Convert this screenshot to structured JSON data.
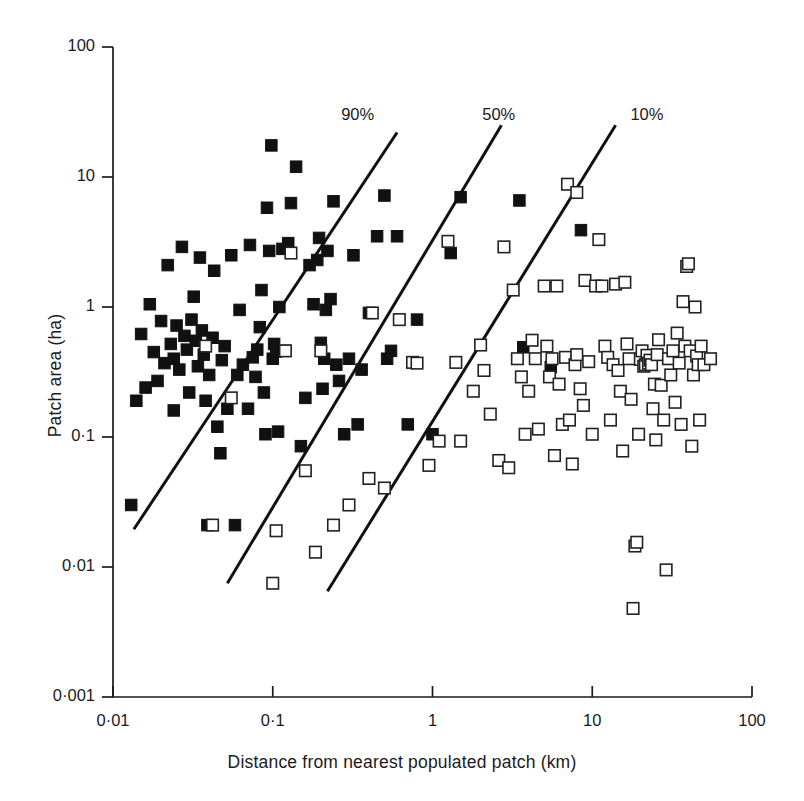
{
  "chart_data": {
    "type": "scatter",
    "title": "",
    "xlabel": "Distance from nearest populated patch (km)",
    "ylabel": "Patch area (ha)",
    "xscale": "log",
    "yscale": "log",
    "xlim": [
      0.01,
      100
    ],
    "ylim": [
      0.001,
      100
    ],
    "grid": false,
    "legend_position": "none",
    "xticks": [
      {
        "value": 0.01,
        "label": "0·01"
      },
      {
        "value": 0.1,
        "label": "0·1"
      },
      {
        "value": 1,
        "label": "1"
      },
      {
        "value": 10,
        "label": "10"
      },
      {
        "value": 100,
        "label": "100"
      }
    ],
    "yticks": [
      {
        "value": 0.001,
        "label": "0·001"
      },
      {
        "value": 0.01,
        "label": "0·01"
      },
      {
        "value": 0.1,
        "label": "0·1"
      },
      {
        "value": 1,
        "label": "1"
      },
      {
        "value": 10,
        "label": "10"
      },
      {
        "value": 100,
        "label": "100"
      }
    ],
    "series": [
      {
        "name": "occupied patch",
        "marker": "filled-square",
        "color": "#111111",
        "points": [
          [
            0.013,
            0.03
          ],
          [
            0.014,
            0.19
          ],
          [
            0.015,
            0.62
          ],
          [
            0.016,
            0.24
          ],
          [
            0.017,
            1.05
          ],
          [
            0.018,
            0.45
          ],
          [
            0.019,
            0.27
          ],
          [
            0.02,
            0.78
          ],
          [
            0.021,
            0.37
          ],
          [
            0.022,
            2.1
          ],
          [
            0.023,
            0.52
          ],
          [
            0.024,
            0.16
          ],
          [
            0.024,
            0.4
          ],
          [
            0.025,
            0.72
          ],
          [
            0.026,
            0.33
          ],
          [
            0.027,
            2.9
          ],
          [
            0.028,
            0.6
          ],
          [
            0.029,
            0.47
          ],
          [
            0.03,
            0.22
          ],
          [
            0.031,
            0.8
          ],
          [
            0.032,
            1.2
          ],
          [
            0.033,
            0.55
          ],
          [
            0.034,
            0.35
          ],
          [
            0.035,
            2.4
          ],
          [
            0.036,
            0.66
          ],
          [
            0.037,
            0.43
          ],
          [
            0.038,
            0.19
          ],
          [
            0.039,
            0.021
          ],
          [
            0.04,
            0.3
          ],
          [
            0.042,
            0.58
          ],
          [
            0.043,
            1.9
          ],
          [
            0.045,
            0.12
          ],
          [
            0.047,
            0.075
          ],
          [
            0.048,
            0.39
          ],
          [
            0.05,
            0.5
          ],
          [
            0.052,
            0.165
          ],
          [
            0.055,
            2.5
          ],
          [
            0.058,
            0.021
          ],
          [
            0.06,
            0.3
          ],
          [
            0.062,
            0.95
          ],
          [
            0.065,
            0.36
          ],
          [
            0.07,
            0.165
          ],
          [
            0.072,
            3.0
          ],
          [
            0.075,
            0.41
          ],
          [
            0.078,
            0.29
          ],
          [
            0.08,
            0.47
          ],
          [
            0.083,
            0.7
          ],
          [
            0.085,
            1.35
          ],
          [
            0.088,
            0.22
          ],
          [
            0.09,
            0.105
          ],
          [
            0.092,
            5.8
          ],
          [
            0.095,
            2.7
          ],
          [
            0.098,
            17.5
          ],
          [
            0.1,
            0.4
          ],
          [
            0.102,
            0.52
          ],
          [
            0.105,
            0.455
          ],
          [
            0.108,
            0.11
          ],
          [
            0.11,
            1.0
          ],
          [
            0.115,
            2.8
          ],
          [
            0.12,
            0.46
          ],
          [
            0.125,
            3.1
          ],
          [
            0.13,
            6.3
          ],
          [
            0.14,
            12.0
          ],
          [
            0.15,
            0.085
          ],
          [
            0.16,
            0.2
          ],
          [
            0.17,
            2.1
          ],
          [
            0.18,
            1.05
          ],
          [
            0.19,
            2.3
          ],
          [
            0.195,
            3.4
          ],
          [
            0.2,
            0.53
          ],
          [
            0.205,
            0.235
          ],
          [
            0.21,
            0.4
          ],
          [
            0.215,
            0.95
          ],
          [
            0.22,
            2.7
          ],
          [
            0.23,
            1.15
          ],
          [
            0.24,
            6.5
          ],
          [
            0.25,
            0.36
          ],
          [
            0.26,
            0.27
          ],
          [
            0.28,
            0.105
          ],
          [
            0.3,
            0.4
          ],
          [
            0.32,
            2.5
          ],
          [
            0.34,
            0.125
          ],
          [
            0.36,
            0.33
          ],
          [
            0.4,
            0.9
          ],
          [
            0.45,
            3.5
          ],
          [
            0.5,
            7.2
          ],
          [
            0.52,
            0.4
          ],
          [
            0.55,
            0.46
          ],
          [
            0.6,
            3.5
          ],
          [
            0.7,
            0.125
          ],
          [
            0.8,
            0.8
          ],
          [
            1.0,
            0.105
          ],
          [
            1.3,
            2.6
          ],
          [
            1.5,
            7.0
          ],
          [
            3.5,
            6.6
          ],
          [
            3.7,
            0.49
          ],
          [
            5.5,
            0.345
          ],
          [
            8.5,
            3.9
          ]
        ]
      },
      {
        "name": "unoccupied patch",
        "marker": "open-square",
        "color": "#222222",
        "points": [
          [
            0.038,
            0.5
          ],
          [
            0.042,
            0.021
          ],
          [
            0.055,
            0.2
          ],
          [
            0.1,
            0.0075
          ],
          [
            0.105,
            0.019
          ],
          [
            0.12,
            0.46
          ],
          [
            0.13,
            2.6
          ],
          [
            0.16,
            0.055
          ],
          [
            0.185,
            0.013
          ],
          [
            0.2,
            0.46
          ],
          [
            0.24,
            0.021
          ],
          [
            0.3,
            0.03
          ],
          [
            0.4,
            0.048
          ],
          [
            0.42,
            0.9
          ],
          [
            0.5,
            0.0405
          ],
          [
            0.62,
            0.8
          ],
          [
            0.75,
            0.375
          ],
          [
            0.8,
            0.37
          ],
          [
            0.95,
            0.0605
          ],
          [
            1.1,
            0.093
          ],
          [
            1.25,
            3.2
          ],
          [
            1.4,
            0.375
          ],
          [
            1.5,
            0.093
          ],
          [
            1.8,
            0.225
          ],
          [
            2.0,
            0.51
          ],
          [
            2.1,
            0.325
          ],
          [
            2.3,
            0.15
          ],
          [
            2.6,
            0.066
          ],
          [
            2.8,
            2.9
          ],
          [
            3.0,
            0.058
          ],
          [
            3.2,
            1.35
          ],
          [
            3.4,
            0.4
          ],
          [
            3.6,
            0.29
          ],
          [
            3.8,
            0.105
          ],
          [
            4.0,
            0.225
          ],
          [
            4.2,
            0.555
          ],
          [
            4.4,
            0.4
          ],
          [
            4.6,
            0.115
          ],
          [
            5.0,
            1.45
          ],
          [
            5.2,
            0.5
          ],
          [
            5.4,
            0.29
          ],
          [
            5.6,
            0.4
          ],
          [
            5.8,
            0.072
          ],
          [
            6.0,
            1.45
          ],
          [
            6.2,
            0.255
          ],
          [
            6.5,
            0.125
          ],
          [
            6.8,
            0.41
          ],
          [
            7.0,
            8.8
          ],
          [
            7.2,
            0.135
          ],
          [
            7.5,
            0.062
          ],
          [
            7.8,
            0.36
          ],
          [
            8.0,
            0.43
          ],
          [
            8.4,
            0.235
          ],
          [
            8.8,
            0.175
          ],
          [
            9.0,
            1.6
          ],
          [
            9.5,
            0.38
          ],
          [
            10.0,
            0.105
          ],
          [
            10.5,
            1.45
          ],
          [
            11.0,
            3.3
          ],
          [
            11.5,
            1.45
          ],
          [
            12.0,
            0.5
          ],
          [
            12.5,
            0.41
          ],
          [
            13.0,
            0.135
          ],
          [
            13.5,
            0.36
          ],
          [
            14.0,
            1.5
          ],
          [
            14.5,
            0.325
          ],
          [
            15.0,
            0.225
          ],
          [
            15.5,
            0.078
          ],
          [
            16.0,
            1.55
          ],
          [
            16.5,
            0.52
          ],
          [
            17.0,
            0.4
          ],
          [
            17.5,
            0.195
          ],
          [
            18.0,
            0.0048
          ],
          [
            18.5,
            0.0145
          ],
          [
            19.0,
            0.0155
          ],
          [
            19.5,
            0.105
          ],
          [
            20.0,
            0.395
          ],
          [
            20.5,
            0.46
          ],
          [
            21.0,
            0.35
          ],
          [
            21.5,
            0.36
          ],
          [
            22.0,
            0.425
          ],
          [
            22.5,
            0.37
          ],
          [
            23.0,
            0.39
          ],
          [
            23.5,
            0.36
          ],
          [
            24.0,
            0.165
          ],
          [
            24.5,
            0.255
          ],
          [
            25.0,
            0.095
          ],
          [
            25.5,
            0.43
          ],
          [
            26.0,
            0.56
          ],
          [
            27.0,
            0.25
          ],
          [
            28.0,
            0.135
          ],
          [
            29.0,
            0.0095
          ],
          [
            30.0,
            0.4
          ],
          [
            31.0,
            0.3
          ],
          [
            32.0,
            0.46
          ],
          [
            33.0,
            0.185
          ],
          [
            34.0,
            0.63
          ],
          [
            35.0,
            0.37
          ],
          [
            36.0,
            0.125
          ],
          [
            37.0,
            1.1
          ],
          [
            38.0,
            0.5
          ],
          [
            39.0,
            2.05
          ],
          [
            40.0,
            2.15
          ],
          [
            41.0,
            0.46
          ],
          [
            42.0,
            0.085
          ],
          [
            43.0,
            0.3
          ],
          [
            44.0,
            1.0
          ],
          [
            45.0,
            0.42
          ],
          [
            46.0,
            0.36
          ],
          [
            47.0,
            0.135
          ],
          [
            48.0,
            0.5
          ],
          [
            50.0,
            0.36
          ],
          [
            8.0,
            7.6
          ],
          [
            55.0,
            0.4
          ]
        ]
      }
    ],
    "annotations": [
      {
        "label": "90%",
        "x": 0.34,
        "y": 30.0,
        "line": {
          "x1": 0.0135,
          "y1": 0.0195,
          "x2": 0.6,
          "y2": 22.0
        }
      },
      {
        "label": "50%",
        "x": 2.6,
        "y": 30.0,
        "line": {
          "x1": 0.052,
          "y1": 0.0075,
          "x2": 2.7,
          "y2": 25.0
        }
      },
      {
        "label": "10%",
        "x": 22.0,
        "y": 30.0,
        "line": {
          "x1": 0.22,
          "y1": 0.0065,
          "x2": 14.0,
          "y2": 25.0
        }
      }
    ]
  }
}
